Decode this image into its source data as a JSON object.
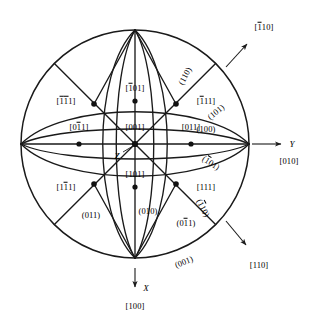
{
  "figure": {
    "type": "stereographic-projection",
    "circle": {
      "cx": 135,
      "cy": 144,
      "r": 114
    },
    "colors": {
      "line": "#1a1a1a",
      "text": "#000000",
      "background": "#ffffff"
    }
  },
  "axes": [
    {
      "name": "y-axis",
      "symbol": "Y",
      "index": "[010]",
      "arrow_from": [
        252,
        144
      ],
      "arrow_to": [
        283,
        144
      ],
      "symbol_pos": [
        291,
        144
      ],
      "index_pos": [
        289,
        160
      ]
    },
    {
      "name": "x-axis",
      "symbol": "X",
      "index": "[100]",
      "arrow_from": [
        135,
        267
      ],
      "arrow_to": [
        135,
        289
      ],
      "symbol_pos": [
        145,
        289
      ],
      "index_pos": [
        135,
        305
      ]
    },
    {
      "name": "z-axis",
      "symbol": "Z",
      "index": null,
      "symbol_pos": [
        116,
        155
      ],
      "leader_from": [
        122,
        152
      ],
      "leader_to": [
        133,
        146
      ]
    }
  ],
  "direction_arrows": [
    {
      "name": "arrow-1bar10",
      "label": "[Đ1 10]",
      "label_text": "110",
      "bar_over": [
        0
      ],
      "from": [
        228,
        66
      ],
      "to": [
        249,
        42
      ],
      "label_pos": [
        263,
        27
      ]
    },
    {
      "name": "arrow-110",
      "label": "[110]",
      "label_text": "110",
      "bar_over": [],
      "from": [
        228,
        222
      ],
      "to": [
        249,
        247
      ],
      "label_pos": [
        258,
        264
      ]
    }
  ],
  "poles": [
    {
      "name": "pole-001",
      "text": "001",
      "bar_over": [],
      "x": 135,
      "y": 144,
      "label_x": 135,
      "label_y": 127,
      "dot": true
    },
    {
      "name": "pole-0bar11",
      "text": "011",
      "bar_over": [
        1
      ],
      "x": 79,
      "y": 144,
      "label_x": 79,
      "label_y": 127,
      "dot": true
    },
    {
      "name": "pole-011",
      "text": "011",
      "bar_over": [],
      "x": 191,
      "y": 144,
      "label_x": 191,
      "label_y": 127,
      "dot": true
    },
    {
      "name": "pole-bar101",
      "text": "101",
      "bar_over": [
        0
      ],
      "x": 135,
      "y": 101,
      "label_x": 135,
      "label_y": 88,
      "dot": true
    },
    {
      "name": "pole-101",
      "text": "101",
      "bar_over": [],
      "x": 135,
      "y": 187,
      "label_x": 135,
      "label_y": 174,
      "dot": true
    },
    {
      "name": "pole-barbar111",
      "text": "111",
      "bar_over": [
        0,
        1
      ],
      "x": 94,
      "y": 104,
      "label_x": 68,
      "label_y": 101,
      "dot": true
    },
    {
      "name": "pole-bar111",
      "text": "111",
      "bar_over": [
        0
      ],
      "x": 176,
      "y": 104,
      "label_x": 203,
      "label_y": 101,
      "dot": true
    },
    {
      "name": "pole-1bar11",
      "text": "111",
      "bar_over": [
        1
      ],
      "x": 94,
      "y": 184,
      "label_x": 68,
      "label_y": 187,
      "dot": true
    },
    {
      "name": "pole-111",
      "text": "111",
      "bar_over": [],
      "x": 176,
      "y": 184,
      "label_x": 203,
      "label_y": 187,
      "dot": true
    }
  ],
  "plane_labels": [
    {
      "name": "plane-100",
      "text": "(100)",
      "x": 203,
      "y": 129,
      "rotate": 0,
      "bar_over": []
    },
    {
      "name": "plane-011",
      "text": "(011)",
      "x": 91,
      "y": 215,
      "rotate": 0,
      "bar_over": []
    },
    {
      "name": "plane-010",
      "text": "(010)",
      "x": 148,
      "y": 211,
      "rotate": 0,
      "bar_over": []
    },
    {
      "name": "plane-0bar11",
      "text": "(011)",
      "x": 186,
      "y": 223,
      "rotate": 0,
      "bar_over": [
        1
      ]
    },
    {
      "name": "plane-001",
      "text": "(001)",
      "x": 184,
      "y": 262,
      "rotate": -22,
      "bar_over": []
    },
    {
      "name": "plane-110",
      "text": "(110)",
      "x": 184,
      "y": 75,
      "rotate": -62,
      "bar_over": []
    },
    {
      "name": "plane-101",
      "text": "(101)",
      "x": 216,
      "y": 112,
      "rotate": -40,
      "bar_over": []
    },
    {
      "name": "plane-bar101",
      "text": "(101)",
      "x": 210,
      "y": 163,
      "rotate": 32,
      "bar_over": [
        0
      ]
    },
    {
      "name": "plane-bar110",
      "text": "(110)",
      "x": 202,
      "y": 208,
      "rotate": 62,
      "bar_over": [
        0
      ]
    }
  ]
}
